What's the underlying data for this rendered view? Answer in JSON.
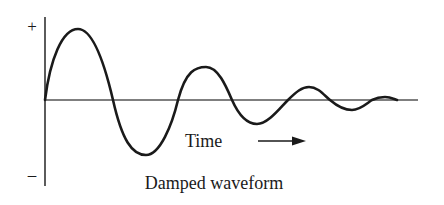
{
  "figure": {
    "caption": "Damped waveform",
    "time_label": "Time",
    "plus_sign": "+",
    "minus_sign": "–",
    "colors": {
      "ink": "#1a1a1a",
      "axis": "#333333",
      "background": "#ffffff"
    }
  },
  "waveform": {
    "type": "damped sinusoid",
    "peaks": [
      {
        "x": 78,
        "y": 29
      },
      {
        "x": 206,
        "y": 67
      },
      {
        "x": 309,
        "y": 87
      },
      {
        "x": 385,
        "y": 97
      }
    ],
    "troughs": [
      {
        "x": 146,
        "y": 155
      },
      {
        "x": 257,
        "y": 124
      },
      {
        "x": 352,
        "y": 110
      }
    ],
    "zero_crossings": [
      45,
      113,
      178,
      288,
      330,
      372,
      397
    ]
  }
}
